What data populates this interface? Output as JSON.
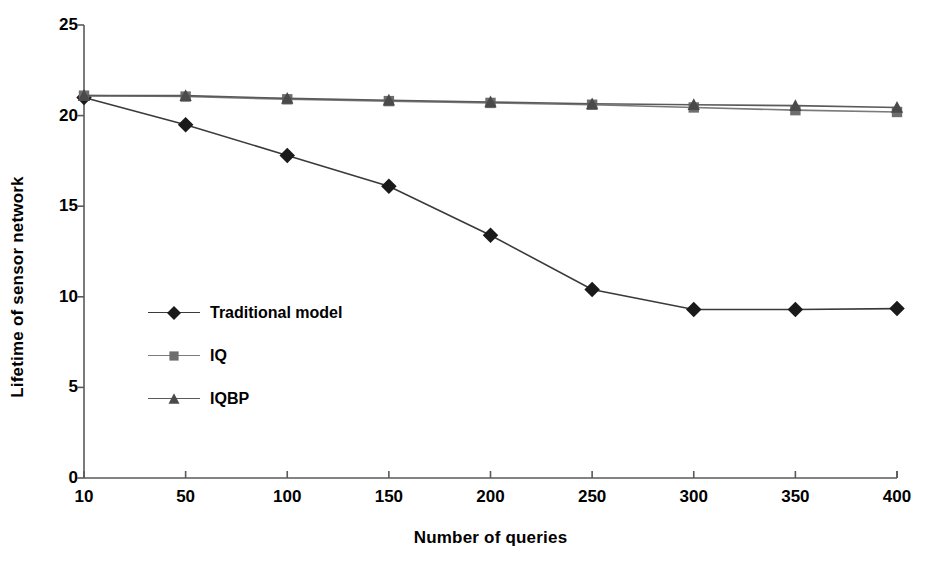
{
  "chart_data": {
    "type": "line",
    "title": "",
    "xlabel": "Number of queries",
    "ylabel": "Lifetime of sensor network",
    "categories": [
      "10",
      "50",
      "100",
      "150",
      "200",
      "250",
      "300",
      "350",
      "400"
    ],
    "ylim": [
      0,
      25
    ],
    "yticks": [
      "0",
      "5",
      "10",
      "15",
      "20",
      "25"
    ],
    "grid": false,
    "legend_position": "inside-left-middle",
    "series": [
      {
        "name": "Traditional model",
        "marker": "diamond",
        "color": "#1a1a1a",
        "line_color": "#3a3a3a",
        "values": [
          21.0,
          19.5,
          17.8,
          16.1,
          13.4,
          10.4,
          9.3,
          9.3,
          9.35
        ]
      },
      {
        "name": "IQ",
        "marker": "square",
        "color": "#6e6e6e",
        "line_color": "#7a7a7a",
        "values": [
          21.1,
          21.05,
          20.9,
          20.8,
          20.7,
          20.6,
          20.45,
          20.3,
          20.2
        ]
      },
      {
        "name": "IQBP",
        "marker": "triangle",
        "color": "#4a4a4a",
        "line_color": "#5a5a5a",
        "values": [
          21.1,
          21.1,
          20.95,
          20.85,
          20.75,
          20.65,
          20.6,
          20.55,
          20.45
        ]
      }
    ]
  },
  "legend": {
    "items": [
      {
        "label": "Traditional model"
      },
      {
        "label": "IQ"
      },
      {
        "label": "IQBP"
      }
    ]
  },
  "colors": {
    "axis": "#5a5a5a",
    "background": "#ffffff",
    "text": "#000000"
  }
}
